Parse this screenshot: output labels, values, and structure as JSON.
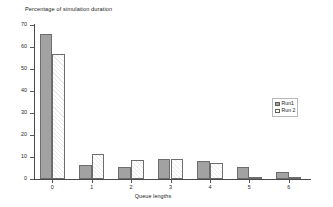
{
  "chart_data": {
    "type": "bar",
    "title": "Percentage of simulation duration",
    "xlabel": "Queue lengths",
    "ylabel": "",
    "categories": [
      "0",
      "1",
      "2",
      "3",
      "4",
      "5",
      "6"
    ],
    "series": [
      {
        "name": "Run1",
        "color": "#a2a2a2",
        "values": [
          66,
          6.4,
          5.5,
          9.2,
          8.2,
          5.6,
          3.1
        ]
      },
      {
        "name": "Run 2",
        "color": "#ffffff",
        "values": [
          57,
          11.4,
          8.6,
          9.2,
          7.1,
          0.6,
          0.4
        ]
      }
    ],
    "ylim": [
      0,
      70
    ],
    "yticks": [
      0,
      10,
      20,
      30,
      40,
      50,
      60,
      70
    ],
    "ytick_labels": [
      "0",
      "10",
      "20",
      "30",
      "40",
      "50",
      "60",
      "70"
    ],
    "grid": false,
    "legend_position": "right"
  },
  "legend": {
    "entries": [
      {
        "label": "Run1",
        "swatch": "solid-gray-swatch"
      },
      {
        "label": "Run 2",
        "swatch": "hatched-white-swatch"
      }
    ]
  }
}
